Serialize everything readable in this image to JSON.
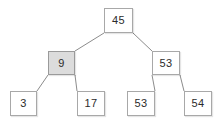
{
  "figure": {
    "type": "binary-search-tree-diagram",
    "width": 222,
    "height": 125,
    "background_color": "#ffffff"
  },
  "style": {
    "node_fill": "#ffffff",
    "node_highlight_fill": "#dcdcdc",
    "node_border_color": "#a8a8a8",
    "edge_color": "#8c8c8c",
    "text_color": "#2b2b2b"
  },
  "tree": {
    "nodes": [
      {
        "id": "root",
        "label": "45",
        "level": 0,
        "highlighted": false,
        "x": 104,
        "y": 8,
        "w": 29,
        "h": 25
      },
      {
        "id": "left",
        "label": "9",
        "level": 1,
        "highlighted": true,
        "x": 48,
        "y": 51,
        "w": 27,
        "h": 24
      },
      {
        "id": "right",
        "label": "53",
        "level": 1,
        "highlighted": false,
        "x": 152,
        "y": 51,
        "w": 28,
        "h": 24
      },
      {
        "id": "left-left",
        "label": "3",
        "level": 2,
        "highlighted": false,
        "x": 10,
        "y": 91,
        "w": 27,
        "h": 25
      },
      {
        "id": "left-right",
        "label": "17",
        "level": 2,
        "highlighted": false,
        "x": 77,
        "y": 91,
        "w": 28,
        "h": 25
      },
      {
        "id": "right-left",
        "label": "53",
        "level": 2,
        "highlighted": false,
        "x": 127,
        "y": 91,
        "w": 28,
        "h": 25
      },
      {
        "id": "right-right",
        "label": "54",
        "level": 2,
        "highlighted": false,
        "x": 184,
        "y": 91,
        "w": 28,
        "h": 25
      }
    ],
    "edges": [
      {
        "id": "root-to-left",
        "from": "root",
        "to": "left",
        "x1": 104,
        "y1": 33,
        "x2": 75,
        "y2": 51
      },
      {
        "id": "root-to-right",
        "from": "root",
        "to": "right",
        "x1": 133,
        "y1": 33,
        "x2": 152,
        "y2": 51
      },
      {
        "id": "left-to-left-left",
        "from": "left",
        "to": "left-left",
        "x1": 48,
        "y1": 75,
        "x2": 37,
        "y2": 91
      },
      {
        "id": "left-to-left-right",
        "from": "left",
        "to": "left-right",
        "x1": 75,
        "y1": 75,
        "x2": 77,
        "y2": 91
      },
      {
        "id": "right-to-right-left",
        "from": "right",
        "to": "right-left",
        "x1": 152,
        "y1": 75,
        "x2": 155,
        "y2": 91
      },
      {
        "id": "right-to-right-right",
        "from": "right",
        "to": "right-right",
        "x1": 180,
        "y1": 75,
        "x2": 184,
        "y2": 91
      }
    ]
  }
}
